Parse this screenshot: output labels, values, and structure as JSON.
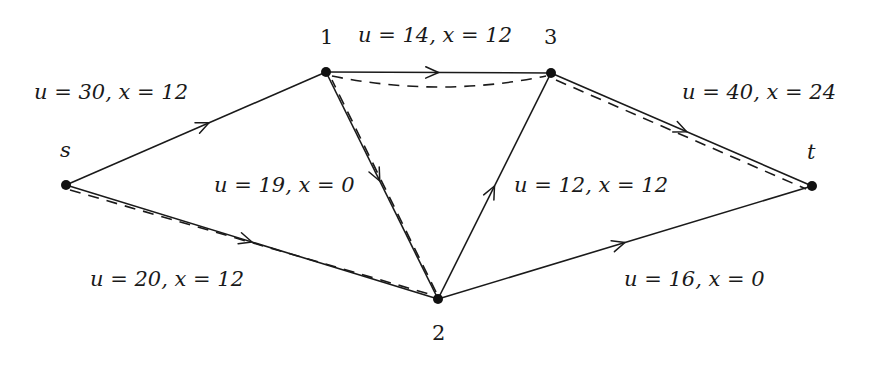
{
  "figure": {
    "type": "flow-network"
  },
  "nodes": [
    {
      "id": "s",
      "label": "s",
      "italic": true
    },
    {
      "id": "1",
      "label": "1",
      "italic": false
    },
    {
      "id": "3",
      "label": "3",
      "italic": false
    },
    {
      "id": "t",
      "label": "t",
      "italic": true
    },
    {
      "id": "2",
      "label": "2",
      "italic": false
    }
  ],
  "edges": [
    {
      "id": "s-1",
      "from": "s",
      "to": "1",
      "u": 30,
      "x": 12,
      "label": "u = 30, x = 12"
    },
    {
      "id": "s-2",
      "from": "s",
      "to": "2",
      "u": 20,
      "x": 12,
      "label": "u = 20, x = 12"
    },
    {
      "id": "1-3",
      "from": "1",
      "to": "3",
      "u": 14,
      "x": 12,
      "label": "u = 14, x = 12"
    },
    {
      "id": "1-2",
      "from": "1",
      "to": "2",
      "u": 19,
      "x": 0,
      "label": "u = 19, x = 0"
    },
    {
      "id": "2-3",
      "from": "2",
      "to": "3",
      "u": 12,
      "x": 12,
      "label": "u = 12, x = 12"
    },
    {
      "id": "3-t",
      "from": "3",
      "to": "t",
      "u": 40,
      "x": 24,
      "label": "u = 40, x = 24"
    },
    {
      "id": "2-t",
      "from": "2",
      "to": "t",
      "u": 16,
      "x": 0,
      "label": "u = 16, x = 0"
    }
  ],
  "dashed_path": [
    "s",
    "2",
    "1",
    "3",
    "t"
  ],
  "colors": {
    "ink": "#1a1a1a",
    "background": "#ffffff"
  }
}
